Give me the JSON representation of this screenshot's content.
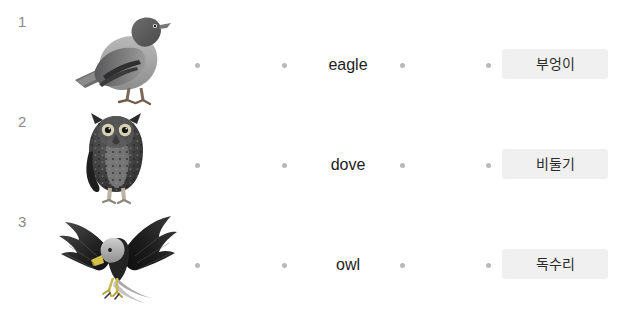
{
  "exercise": {
    "type": "matching-exercise",
    "background_color": "#ffffff",
    "chip_color": "#f0f0f0",
    "dot_color": "#b9b9b9",
    "number_color": "#8a8a8a",
    "rows": [
      {
        "number": "1",
        "image_name": "pigeon-photo",
        "image_alt": "pigeon",
        "english_word": "eagle",
        "korean_word": "부엉이"
      },
      {
        "number": "2",
        "image_name": "owl-photo",
        "image_alt": "owl",
        "english_word": "dove",
        "korean_word": "비둘기"
      },
      {
        "number": "3",
        "image_name": "eagle-photo",
        "image_alt": "eagle in flight",
        "english_word": "owl",
        "korean_word": "독수리"
      }
    ]
  }
}
